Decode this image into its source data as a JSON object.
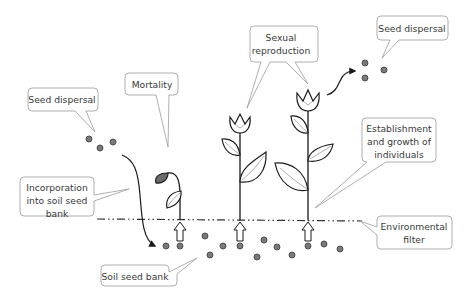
{
  "diagram": {
    "labels": {
      "seed_dispersal_left": "Seed dispersal",
      "mortality": "Mortality",
      "sexual_reproduction_1": "Sexual",
      "sexual_reproduction_2": "reproduction",
      "seed_dispersal_right": "Seed dispersal",
      "establishment_1": "Establishment",
      "establishment_2": "and growth of",
      "establishment_3": "individuals",
      "incorporation_1": "Incorporation",
      "incorporation_2": "into soil seed",
      "incorporation_3": "bank",
      "environmental_filter_1": "Environmental",
      "environmental_filter_2": "filter",
      "soil_seed_bank": "Soil seed bank"
    },
    "colors": {
      "seed_fill": "#7a7a7a",
      "outline": "#1a1a1a",
      "callout_border": "#9a9a9a",
      "dead_leaf": "#6b6b6b"
    },
    "nodes": [
      {
        "id": "seed-dispersal-left",
        "type": "callout"
      },
      {
        "id": "mortality",
        "type": "callout"
      },
      {
        "id": "sexual-reproduction",
        "type": "callout"
      },
      {
        "id": "seed-dispersal-right",
        "type": "callout"
      },
      {
        "id": "establishment",
        "type": "callout"
      },
      {
        "id": "incorporation",
        "type": "callout"
      },
      {
        "id": "environmental-filter",
        "type": "callout"
      },
      {
        "id": "soil-seed-bank",
        "type": "callout"
      },
      {
        "id": "dying-plant",
        "type": "illustration"
      },
      {
        "id": "flowering-plant-1",
        "type": "illustration"
      },
      {
        "id": "flowering-plant-2",
        "type": "illustration"
      }
    ],
    "edges": [
      {
        "from": "seed-dispersal-left",
        "to": "soil-seed-bank",
        "label": "Incorporation into soil seed bank"
      },
      {
        "from": "soil-seed-bank",
        "to": "dying-plant",
        "label": "Environmental filter"
      },
      {
        "from": "soil-seed-bank",
        "to": "flowering-plant-1",
        "label": "Environmental filter"
      },
      {
        "from": "soil-seed-bank",
        "to": "flowering-plant-2",
        "label": "Environmental filter"
      },
      {
        "from": "flowering-plant-2",
        "to": "seed-dispersal-right",
        "label": ""
      }
    ]
  }
}
